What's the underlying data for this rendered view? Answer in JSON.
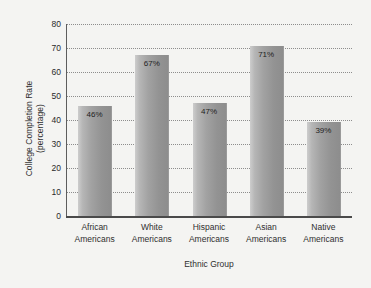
{
  "chart_data": {
    "type": "bar",
    "title": "",
    "xlabel": "Ethnic Group",
    "ylabel_line1": "College Completion Rate",
    "ylabel_line2": "(percentage)",
    "categories": [
      "African\nAmericans",
      "White\nAmericans",
      "Hispanic\nAmericans",
      "Asian\nAmericans",
      "Native\nAmericans"
    ],
    "category_lines": [
      {
        "line1": "African",
        "line2": "Americans"
      },
      {
        "line1": "White",
        "line2": "Americans"
      },
      {
        "line1": "Hispanic",
        "line2": "Americans"
      },
      {
        "line1": "Asian",
        "line2": "Americans"
      },
      {
        "line1": "Native",
        "line2": "Americans"
      }
    ],
    "values": [
      46,
      67,
      47,
      71,
      39
    ],
    "data_labels": [
      "46%",
      "67%",
      "47%",
      "71%",
      "39%"
    ],
    "ylim": [
      0,
      80
    ],
    "yticks": [
      0,
      10,
      20,
      30,
      40,
      50,
      60,
      70,
      80
    ],
    "ytick_labels": [
      "0",
      "10",
      "20",
      "30",
      "40",
      "50",
      "60",
      "70",
      "80"
    ],
    "grid": true,
    "grid_style": "dotted",
    "legend": null,
    "bar_fill_light": "#cdcdcd",
    "bar_fill_dark": "#8d8d8d",
    "plot_background": "#f2f2f0",
    "page_background": "#f4f4f2",
    "axis_color": "#4a4a4a",
    "grid_color": "#8d8d8d",
    "text_color": "#2f2f2f"
  }
}
